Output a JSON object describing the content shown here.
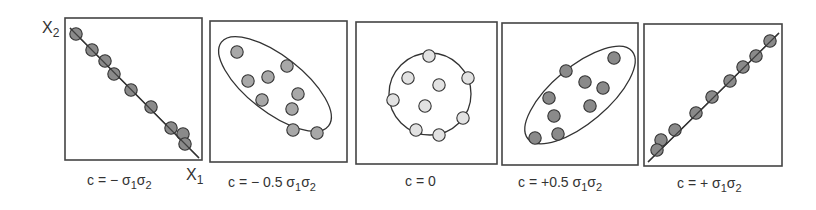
{
  "figure": {
    "axis_labels": {
      "y": "X",
      "y_sub": "2",
      "x": "X",
      "x_sub": "1"
    },
    "colors": {
      "dot_dark": "#8a8a8a",
      "dot_mid": "#a8a8a8",
      "dot_light": "#e2e2e2",
      "stroke": "#333333"
    },
    "panels": [
      {
        "id": "neg-full",
        "box": [
          65,
          18,
          202,
          160
        ],
        "label": {
          "text": "c = − σ",
          "s1": "1",
          "mid": "σ",
          "s2": "2",
          "x": 87,
          "y": 185
        },
        "shape": {
          "type": "line",
          "x1": 70,
          "y1": 28,
          "x2": 199,
          "y2": 158
        },
        "fill": "#8a8a8a",
        "dots": [
          [
            76,
            34
          ],
          [
            92,
            50
          ],
          [
            105,
            61
          ],
          [
            114,
            74
          ],
          [
            131,
            90
          ],
          [
            151,
            107
          ],
          [
            171,
            128
          ],
          [
            183,
            134
          ],
          [
            185,
            144
          ]
        ]
      },
      {
        "id": "neg-half",
        "box": [
          210,
          21,
          347,
          162
        ],
        "label": {
          "text": "c = − 0.5 σ",
          "s1": "1",
          "mid": "σ",
          "s2": "2",
          "x": 228,
          "y": 187
        },
        "shape": {
          "type": "ellipse",
          "cx": 275,
          "cy": 84,
          "rx": 68,
          "ry": 28,
          "rot": 38
        },
        "fill": "#a8a8a8",
        "dots": [
          [
            237,
            52
          ],
          [
            248,
            81
          ],
          [
            268,
            77
          ],
          [
            287,
            66
          ],
          [
            262,
            100
          ],
          [
            298,
            94
          ],
          [
            292,
            109
          ],
          [
            293,
            130
          ],
          [
            317,
            133
          ]
        ]
      },
      {
        "id": "zero",
        "box": [
          356,
          22,
          497,
          164
        ],
        "label": {
          "text": "c = 0",
          "x": 405,
          "y": 186
        },
        "shape": {
          "type": "ellipse",
          "cx": 430,
          "cy": 94,
          "rx": 41,
          "ry": 41,
          "rot": 0
        },
        "fill": "#e2e2e2",
        "dots": [
          [
            429,
            56
          ],
          [
            408,
            78
          ],
          [
            468,
            78
          ],
          [
            439,
            85
          ],
          [
            393,
            100
          ],
          [
            425,
            106
          ],
          [
            463,
            118
          ],
          [
            416,
            130
          ],
          [
            439,
            135
          ]
        ]
      },
      {
        "id": "pos-half",
        "box": [
          502,
          23,
          638,
          165
        ],
        "label": {
          "text": "c = +0.5 σ",
          "s1": "1",
          "mid": "σ",
          "s2": "2",
          "x": 518,
          "y": 187
        },
        "shape": {
          "type": "ellipse",
          "cx": 580,
          "cy": 95,
          "rx": 68,
          "ry": 28,
          "rot": -40
        },
        "fill": "#8a8a8a",
        "dots": [
          [
            614,
            58
          ],
          [
            566,
            71
          ],
          [
            585,
            82
          ],
          [
            603,
            88
          ],
          [
            549,
            98
          ],
          [
            554,
            116
          ],
          [
            590,
            106
          ],
          [
            558,
            134
          ],
          [
            535,
            138
          ]
        ]
      },
      {
        "id": "pos-full",
        "box": [
          644,
          24,
          782,
          166
        ],
        "label": {
          "text": "c = + σ",
          "s1": "1",
          "mid": "σ",
          "s2": "2",
          "x": 677,
          "y": 188
        },
        "shape": {
          "type": "line",
          "x1": 648,
          "y1": 162,
          "x2": 779,
          "y2": 33
        },
        "fill": "#8a8a8a",
        "dots": [
          [
            770,
            41
          ],
          [
            756,
            56
          ],
          [
            743,
            67
          ],
          [
            730,
            81
          ],
          [
            712,
            97
          ],
          [
            696,
            113
          ],
          [
            675,
            130
          ],
          [
            661,
            140
          ],
          [
            657,
            150
          ]
        ]
      }
    ]
  },
  "chart_data": {
    "type": "scatter",
    "title": "",
    "xlabel": "X1",
    "ylabel": "X2",
    "panels": [
      {
        "label": "c = −σ1σ2",
        "correlation": -1.0,
        "n_points": 9
      },
      {
        "label": "c = −0.5 σ1σ2",
        "correlation": -0.5,
        "n_points": 9
      },
      {
        "label": "c = 0",
        "correlation": 0.0,
        "n_points": 9
      },
      {
        "label": "c = +0.5 σ1σ2",
        "correlation": 0.5,
        "n_points": 9
      },
      {
        "label": "c = +σ1σ2",
        "correlation": 1.0,
        "n_points": 9
      }
    ]
  }
}
